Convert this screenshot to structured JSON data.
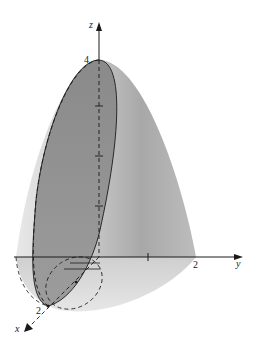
{
  "figure": {
    "axes": {
      "x": {
        "label": "x",
        "tick_label": "2"
      },
      "y": {
        "label": "y",
        "tick_label": "2"
      },
      "z": {
        "label": "z",
        "tick_label": "4"
      }
    },
    "colors": {
      "background": "#ffffff",
      "surface_light": "#e4e4e4",
      "surface_mid": "#c4c4c4",
      "surface_dark": "#a2a2a2",
      "ellipse_fill": "#8f8f8f",
      "line": "#1a1a1a"
    }
  }
}
